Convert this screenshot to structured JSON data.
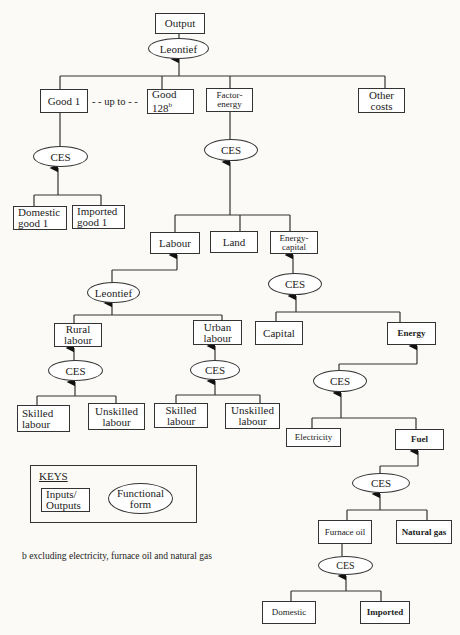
{
  "diagram": {
    "top": {
      "output": "Output",
      "leontief": "Leontief"
    },
    "level1": {
      "good1": "Good 1",
      "upto": "- - up to - -",
      "good128": "Good 128",
      "good128_sup": "b",
      "factor_energy": "Factor-energy",
      "other_costs": "Other costs"
    },
    "good1_branch": {
      "ces": "CES",
      "domestic": "Domestic good 1",
      "imported": "Imported good 1"
    },
    "factor_branch": {
      "ces": "CES",
      "labour": "Labour",
      "land": "Land",
      "energy_capital": "Energy-capital"
    },
    "labour_branch": {
      "leontief": "Leontief",
      "rural": "Rural labour",
      "urban": "Urban labour",
      "rural_ces": "CES",
      "urban_ces": "CES",
      "rural_skilled": "Skilled labour",
      "rural_unskilled": "Unskilled labour",
      "urban_skilled": "Skilled labour",
      "urban_unskilled": "Unskilled labour"
    },
    "energy_capital_branch": {
      "ces": "CES",
      "capital": "Capital",
      "energy": "Energy"
    },
    "energy_branch": {
      "ces": "CES",
      "electricity": "Electricity",
      "fuel": "Fuel"
    },
    "fuel_branch": {
      "ces": "CES",
      "furnace_oil": "Furnace oil",
      "natural_gas": "Natural gas"
    },
    "furnace_branch": {
      "ces": "CES",
      "domestic": "Domestic",
      "imported": "Imported"
    }
  },
  "keys": {
    "title": "KEYS",
    "box_label": "Inputs/ Outputs",
    "ellipse_label": "Functional form"
  },
  "footnote": "b  excluding electricity, furnace oil and natural gas"
}
